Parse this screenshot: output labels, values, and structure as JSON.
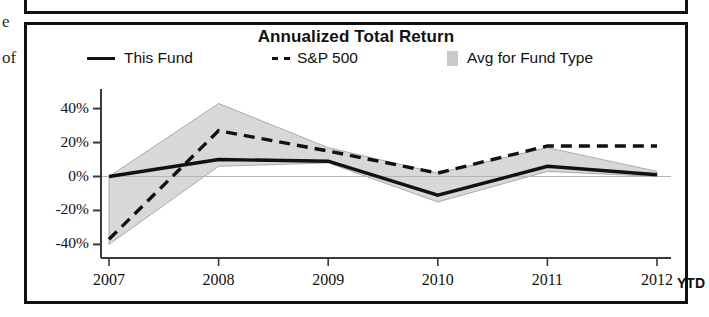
{
  "margin_fragments": {
    "frag1": "e",
    "frag2": "of"
  },
  "chart_data": {
    "type": "line",
    "title": "Annualized Total Return",
    "xlabel": "",
    "ylabel": "",
    "categories": [
      "2007",
      "2008",
      "2009",
      "2010",
      "2011",
      "2012"
    ],
    "x_axis_suffix": "YTD",
    "ytick_labels": [
      "40%",
      "20%",
      "0%",
      "-20%",
      "-40%"
    ],
    "ytick_values": [
      40,
      20,
      0,
      -20,
      -40
    ],
    "ylim": [
      -48,
      48
    ],
    "grid": false,
    "legend_position": "top",
    "series": [
      {
        "name": "This Fund",
        "style": "solid",
        "color": "#111111",
        "values": [
          0,
          10,
          9,
          -11,
          6,
          1
        ]
      },
      {
        "name": "S&P 500",
        "style": "dashed",
        "color": "#111111",
        "legend_prefix": "---",
        "values": [
          -37,
          27,
          15,
          2,
          18,
          18
        ]
      },
      {
        "name": "Avg for Fund Type",
        "style": "band",
        "color": "#c9c9c9",
        "band_upper": [
          0,
          43,
          17,
          2,
          17,
          3
        ],
        "band_lower": [
          -40,
          6,
          8,
          -15,
          3,
          0
        ]
      }
    ]
  }
}
